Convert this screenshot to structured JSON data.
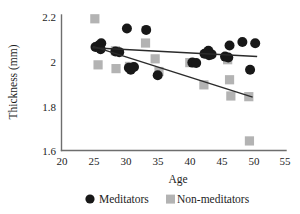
{
  "figure": {
    "caption_title": "",
    "background_color": "#ffffff"
  },
  "axes": {
    "y_title": "Thickness (mm)",
    "x_title": "Age",
    "y_ticks": [
      "2.2",
      "2",
      "1.8",
      "1.6"
    ],
    "x_ticks": [
      "20",
      "25",
      "30",
      "35",
      "40",
      "45",
      "50",
      "55"
    ],
    "axis_color": "#6e6e6e"
  },
  "legend": {
    "items": [
      {
        "label": "Meditators",
        "marker": "circle",
        "color": "#181818"
      },
      {
        "label": "Non-meditators",
        "marker": "square",
        "color": "#b3b3b3"
      }
    ]
  },
  "chart_data": {
    "type": "scatter",
    "title": "",
    "subtitle": "",
    "xlabel": "Age",
    "ylabel": "Thickness (mm)",
    "xlim": [
      20,
      55
    ],
    "ylim": [
      1.6,
      2.2
    ],
    "xticks": [
      20,
      25,
      30,
      35,
      40,
      45,
      50,
      55
    ],
    "yticks": [
      1.6,
      1.8,
      2.0,
      2.2
    ],
    "grid": false,
    "legend_position": "bottom-center",
    "series": [
      {
        "name": "Meditators",
        "marker": "circle",
        "color": "#181818",
        "points": [
          [
            25.3,
            2.065
          ],
          [
            25.8,
            2.072
          ],
          [
            26.2,
            2.082
          ],
          [
            26.1,
            2.055
          ],
          [
            28.4,
            2.045
          ],
          [
            29.0,
            2.042
          ],
          [
            30.2,
            2.148
          ],
          [
            30.5,
            1.972
          ],
          [
            30.8,
            1.963
          ],
          [
            31.3,
            1.975
          ],
          [
            33.2,
            2.142
          ],
          [
            35.0,
            1.938
          ],
          [
            40.4,
            1.995
          ],
          [
            41.0,
            1.993
          ],
          [
            42.3,
            2.035
          ],
          [
            42.9,
            2.048
          ],
          [
            43.0,
            2.028
          ],
          [
            43.4,
            2.032
          ],
          [
            45.5,
            2.022
          ],
          [
            46.0,
            2.018
          ],
          [
            46.2,
            2.072
          ],
          [
            48.2,
            2.088
          ],
          [
            49.4,
            1.963
          ],
          [
            50.2,
            2.082
          ]
        ],
        "trend_line": {
          "x1": 24.8,
          "y1": 2.062,
          "x2": 50.5,
          "y2": 2.022
        }
      },
      {
        "name": "Non-meditators",
        "marker": "square",
        "color": "#b3b3b3",
        "points": [
          [
            25.2,
            2.192
          ],
          [
            25.7,
            1.985
          ],
          [
            28.4,
            2.048
          ],
          [
            28.5,
            1.968
          ],
          [
            30.6,
            1.978
          ],
          [
            33.1,
            2.083
          ],
          [
            34.6,
            2.012
          ],
          [
            35.2,
            1.955
          ],
          [
            40.0,
            1.995
          ],
          [
            42.2,
            1.895
          ],
          [
            45.9,
            2.008
          ],
          [
            46.2,
            1.918
          ],
          [
            46.4,
            1.845
          ],
          [
            49.2,
            1.842
          ],
          [
            49.3,
            1.643
          ]
        ],
        "trend_line": {
          "x1": 24.9,
          "y1": 2.068,
          "x2": 49.8,
          "y2": 1.84
        }
      }
    ],
    "annotations": []
  }
}
